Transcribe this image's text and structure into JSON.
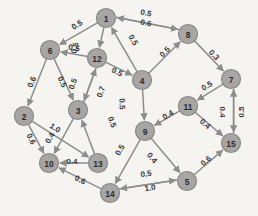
{
  "figure": {
    "title": "",
    "background_color": "#f6f4f1",
    "node_fill_color": "#a8a6a4",
    "node_stroke_color": "#8a8886",
    "edge_color": "#8d8d8d",
    "label_color": "#3a3836",
    "width": 258,
    "height": 216
  },
  "chart_data": {
    "type": "diagram",
    "graph_kind": "directed-weighted-graph",
    "title": "",
    "xlabel": "",
    "ylabel": "",
    "grid": false,
    "legend": null,
    "node_count": 15,
    "edge_count": 29,
    "nodes": [
      {
        "id": "1",
        "label": "1",
        "x": 106,
        "y": 18
      },
      {
        "id": "2",
        "label": "2",
        "x": 24,
        "y": 116
      },
      {
        "id": "3",
        "label": "3",
        "x": 78,
        "y": 110
      },
      {
        "id": "4",
        "label": "4",
        "x": 142,
        "y": 80
      },
      {
        "id": "5",
        "label": "5",
        "x": 187,
        "y": 181
      },
      {
        "id": "6",
        "label": "6",
        "x": 50,
        "y": 50
      },
      {
        "id": "7",
        "label": "7",
        "x": 231,
        "y": 79
      },
      {
        "id": "8",
        "label": "8",
        "x": 188,
        "y": 34
      },
      {
        "id": "9",
        "label": "9",
        "x": 145,
        "y": 131
      },
      {
        "id": "10",
        "label": "10",
        "x": 49,
        "y": 163
      },
      {
        "id": "11",
        "label": "11",
        "x": 188,
        "y": 106
      },
      {
        "id": "12",
        "label": "12",
        "x": 97,
        "y": 58
      },
      {
        "id": "13",
        "label": "13",
        "x": 98,
        "y": 163
      },
      {
        "id": "14",
        "label": "14",
        "x": 110,
        "y": 193
      },
      {
        "id": "15",
        "label": "15",
        "x": 231,
        "y": 143
      }
    ],
    "edges": [
      {
        "source": "1",
        "target": "6",
        "weight": "0.5",
        "lx": 77,
        "ly": 25
      },
      {
        "source": "1",
        "target": "12",
        "weight": "0.5",
        "lx": 75,
        "ly": 48
      },
      {
        "source": "1",
        "target": "8",
        "weight": "0.5",
        "lx": 146,
        "ly": 13
      },
      {
        "source": "8",
        "target": "1",
        "weight": "0.6",
        "lx": 146,
        "ly": 23
      },
      {
        "source": "4",
        "target": "1",
        "weight": "0.5",
        "lx": 133,
        "ly": 40
      },
      {
        "source": "4",
        "target": "8",
        "weight": "0.5",
        "lx": 165,
        "ly": 52
      },
      {
        "source": "8",
        "target": "7",
        "weight": "0.3",
        "lx": 214,
        "ly": 55
      },
      {
        "source": "6",
        "target": "2",
        "weight": "0.6",
        "lx": 32,
        "ly": 82
      },
      {
        "source": "6",
        "target": "3",
        "weight": "0.5",
        "lx": 62,
        "ly": 82
      },
      {
        "source": "12",
        "target": "6",
        "weight": "0.5",
        "lx": 74,
        "ly": 48
      },
      {
        "source": "12",
        "target": "3",
        "weight": "0.5",
        "lx": 73,
        "ly": 84
      },
      {
        "source": "3",
        "target": "12",
        "weight": "0.7",
        "lx": 101,
        "ly": 92
      },
      {
        "source": "12",
        "target": "4",
        "weight": "0.5",
        "lx": 117,
        "ly": 72
      },
      {
        "source": "2",
        "target": "10",
        "weight": "0.6",
        "lx": 31,
        "ly": 139
      },
      {
        "source": "2",
        "target": "13",
        "weight": "1.0",
        "lx": 55,
        "ly": 128
      },
      {
        "source": "3",
        "target": "10",
        "weight": "0.4",
        "lx": 50,
        "ly": 138
      },
      {
        "source": "13",
        "target": "10",
        "weight": "0.4",
        "lx": 72,
        "ly": 161
      },
      {
        "source": "13",
        "target": "3",
        "weight": "0.5",
        "lx": 112,
        "ly": 122
      },
      {
        "source": "14",
        "target": "10",
        "weight": "0.6",
        "lx": 80,
        "ly": 180
      },
      {
        "source": "4",
        "target": "9",
        "weight": "0.5",
        "lx": 122,
        "ly": 104
      },
      {
        "source": "9",
        "target": "14",
        "weight": "0.5",
        "lx": 120,
        "ly": 150
      },
      {
        "source": "11",
        "target": "9",
        "weight": "0.4",
        "lx": 168,
        "ly": 115
      },
      {
        "source": "9",
        "target": "5",
        "weight": "0.4",
        "lx": 152,
        "ly": 158
      },
      {
        "source": "14",
        "target": "5",
        "weight": "0.5",
        "lx": 146,
        "ly": 174
      },
      {
        "source": "5",
        "target": "14",
        "weight": "1.0",
        "lx": 150,
        "ly": 188
      },
      {
        "source": "5",
        "target": "15",
        "weight": "0.6",
        "lx": 206,
        "ly": 161
      },
      {
        "source": "11",
        "target": "15",
        "weight": "0.4",
        "lx": 205,
        "ly": 124
      },
      {
        "source": "7",
        "target": "15",
        "weight": "0.4",
        "lx": 222,
        "ly": 112
      },
      {
        "source": "15",
        "target": "7",
        "weight": "0.5",
        "lx": 241,
        "ly": 112
      },
      {
        "source": "7",
        "target": "11",
        "weight": "0.5",
        "lx": 207,
        "ly": 86
      }
    ]
  }
}
